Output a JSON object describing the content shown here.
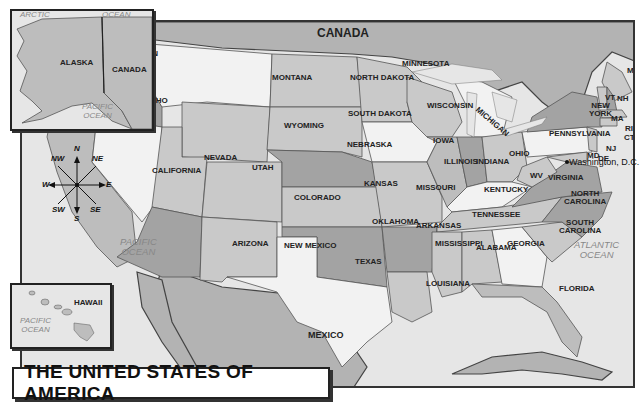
{
  "title": "THE UNITED STATES OF AMERICA",
  "countries": {
    "canada": "CANADA",
    "mexico": "MEXICO"
  },
  "oceans": {
    "pacific_main": [
      "PACIFIC",
      "OCEAN"
    ],
    "atlantic": [
      "ATLANTIC",
      "OCEAN"
    ],
    "alaska_arctic": [
      "ARCTIC",
      "OCEAN"
    ],
    "alaska_pacific": [
      "PACIFIC",
      "OCEAN"
    ],
    "hawaii_pacific": [
      "PACIFIC",
      "OCEAN"
    ]
  },
  "insets": {
    "alaska": {
      "state": "ALASKA",
      "country": "CANADA"
    },
    "hawaii": {
      "state": "HAWAII"
    }
  },
  "compass": {
    "n": "N",
    "ne": "NE",
    "e": "E",
    "se": "SE",
    "s": "S",
    "sw": "SW",
    "w": "W",
    "nw": "NW"
  },
  "capital": {
    "label": "Washington, D.C."
  },
  "states": {
    "washington": "WASHINGTON",
    "oregon": "OREGON",
    "california": "CALIFORNIA",
    "idaho": "IDAHO",
    "nevada": "NEVADA",
    "montana": "MONTANA",
    "wyoming": "WYOMING",
    "utah": "UTAH",
    "arizona": "ARIZONA",
    "colorado": "COLORADO",
    "new_mexico": "NEW MEXICO",
    "north_dakota": "NORTH DAKOTA",
    "south_dakota": "SOUTH DAKOTA",
    "nebraska": "NEBRASKA",
    "kansas": "KANSAS",
    "oklahoma": "OKLAHOMA",
    "texas": "TEXAS",
    "minnesota": "MINNESOTA",
    "iowa": "IOWA",
    "missouri": "MISSOURI",
    "arkansas": "ARKANSAS",
    "louisiana": "LOUISIANA",
    "wisconsin": "WISCONSIN",
    "illinois": "ILLINOIS",
    "michigan": "MICHIGAN",
    "indiana": "INDIANA",
    "ohio": "OHIO",
    "kentucky": "KENTUCKY",
    "tennessee": "TENNESSEE",
    "mississippi": "MISSISSIPPI",
    "alabama": "ALABAMA",
    "georgia": "GEORGIA",
    "florida": "FLORIDA",
    "south_carolina": [
      "SOUTH",
      "CAROLINA"
    ],
    "north_carolina": [
      "NORTH",
      "CAROLINA"
    ],
    "virginia": "VIRGINIA",
    "west_virginia": "WV",
    "pennsylvania": "PENNSYLVANIA",
    "new_york": [
      "NEW",
      "YORK"
    ],
    "maryland": "MD",
    "delaware": "DE",
    "new_jersey": "NJ",
    "connecticut": "CT",
    "rhode_island": "RI",
    "massachusetts": "MA",
    "vermont": "VT",
    "new_hampshire": "NH",
    "maine": "MAINE"
  },
  "colors": {
    "water": "#e6e6e6",
    "land_light": "#f2f2f2",
    "land_mid": "#bdbdbd",
    "land_dark": "#a3a3a3",
    "foreign": "#b3b3b3",
    "border": "#333333"
  }
}
